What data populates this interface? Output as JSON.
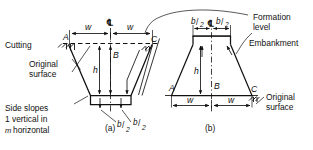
{
  "figure": {
    "title_labels": {
      "cutting": "Cutting",
      "original_surface_left": "Original\nsurface",
      "original_surface_left_line1": "Original",
      "original_surface_left_line2": "surface",
      "side_slopes_line1": "Side slopes",
      "side_slopes_line2_pre": "1 vertical in",
      "side_slopes_line3_m": "m",
      "side_slopes_line3_rest": "horizontal",
      "formation_level_line1": "Formation",
      "formation_level_line2": "level",
      "embankment": "Embankment",
      "original_surface_right_line1": "Original",
      "original_surface_right_line2": "surface"
    },
    "sub_captions": {
      "left": "(a)",
      "right": "(b)"
    },
    "centreline_symbol": "℄",
    "dimensions": {
      "half_width_symbol": "w",
      "height_symbol": "h",
      "centre_depth_symbol": "B",
      "formation_half_num": "b",
      "formation_half_den": "2",
      "formation_half_slash": "/"
    },
    "point_labels": {
      "a_left": "A",
      "c_left": "C",
      "a_right": "A",
      "c_right": "C"
    },
    "colors": {
      "ink": "#111111",
      "paper": "#ffffff"
    }
  }
}
